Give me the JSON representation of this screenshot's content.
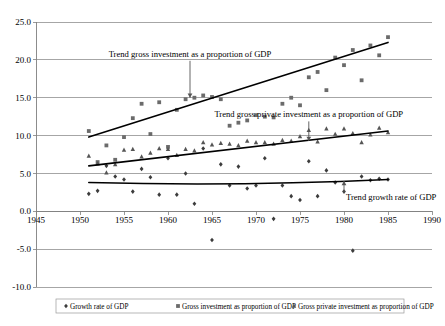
{
  "chart_data": {
    "type": "scatter",
    "title": "",
    "subtitle": "",
    "xlabel": "",
    "ylabel": "",
    "xlim": [
      1945,
      1990
    ],
    "ylim": [
      -10.0,
      25.0
    ],
    "grid": true,
    "legend_position": "bottom",
    "y_ticks": [
      "25.0",
      "20.0",
      "15.0",
      "10.0",
      "5.0",
      "0.0",
      "-5.0",
      "-10.0"
    ],
    "y_tick_values": [
      25.0,
      20.0,
      15.0,
      10.0,
      5.0,
      0.0,
      -5.0,
      -10.0
    ],
    "x_ticks": [
      "1945",
      "1950",
      "1955",
      "1960",
      "1965",
      "1970",
      "1975",
      "1980",
      "1985",
      "1990"
    ],
    "x_tick_values": [
      1945,
      1950,
      1955,
      1960,
      1965,
      1970,
      1975,
      1980,
      1985,
      1990
    ],
    "series": [
      {
        "name": "Growth rate of GDP",
        "marker": "diamond",
        "color": "#3c3c3c",
        "x": [
          1951,
          1952,
          1953,
          1954,
          1955,
          1956,
          1957,
          1958,
          1959,
          1960,
          1961,
          1962,
          1963,
          1964,
          1965,
          1966,
          1967,
          1968,
          1969,
          1970,
          1971,
          1972,
          1973,
          1974,
          1975,
          1976,
          1977,
          1978,
          1979,
          1980,
          1981,
          1982,
          1983,
          1984,
          1985
        ],
        "y": [
          2.3,
          2.7,
          6.0,
          4.6,
          4.2,
          2.6,
          5.6,
          4.5,
          2.2,
          7.0,
          2.2,
          5.0,
          1.0,
          8.3,
          -3.8,
          6.2,
          3.4,
          5.9,
          3.0,
          3.4,
          7.0,
          -1.0,
          3.4,
          2.0,
          1.5,
          6.6,
          2.0,
          5.4,
          3.8,
          2.6,
          -5.2,
          4.6,
          4.1,
          4.3,
          4.2
        ]
      },
      {
        "name": "Gross investment as proportion of GDP",
        "marker": "square",
        "color": "#6b6b6b",
        "x": [
          1951,
          1952,
          1953,
          1954,
          1955,
          1956,
          1957,
          1958,
          1959,
          1960,
          1961,
          1962,
          1963,
          1964,
          1965,
          1966,
          1967,
          1968,
          1969,
          1970,
          1971,
          1972,
          1973,
          1974,
          1975,
          1976,
          1977,
          1978,
          1979,
          1980,
          1981,
          1982,
          1983,
          1984,
          1985
        ],
        "y": [
          10.6,
          6.5,
          8.7,
          6.8,
          9.8,
          12.3,
          14.2,
          10.2,
          14.4,
          8.5,
          13.4,
          14.8,
          15.0,
          15.3,
          15.1,
          14.8,
          11.3,
          11.7,
          12.0,
          12.7,
          12.5,
          12.4,
          14.2,
          15.0,
          14.0,
          17.7,
          18.4,
          16.0,
          20.3,
          19.3,
          21.3,
          17.3,
          21.9,
          20.6,
          23.0
        ]
      },
      {
        "name": "Gross private investment as proportion of GDP",
        "marker": "triangle",
        "color": "#555555",
        "x": [
          1951,
          1952,
          1953,
          1954,
          1955,
          1956,
          1957,
          1958,
          1959,
          1960,
          1961,
          1962,
          1963,
          1964,
          1965,
          1966,
          1967,
          1968,
          1969,
          1970,
          1971,
          1972,
          1973,
          1974,
          1975,
          1976,
          1977,
          1978,
          1979,
          1980,
          1981,
          1982,
          1983,
          1984,
          1985
        ],
        "y": [
          7.3,
          6.3,
          5.1,
          6.2,
          8.1,
          8.2,
          7.2,
          7.7,
          8.3,
          8.2,
          7.4,
          8.2,
          8.0,
          9.1,
          8.8,
          9.0,
          8.9,
          8.7,
          9.3,
          9.1,
          9.1,
          8.9,
          9.4,
          9.3,
          9.9,
          10.7,
          9.2,
          10.9,
          10.2,
          10.9,
          10.3,
          9.1,
          10.1,
          11.0,
          10.4
        ]
      }
    ],
    "trends": [
      {
        "name": "Trend gross investment as a proportion of GDP",
        "x": [
          1951,
          1985
        ],
        "y": [
          9.8,
          22.3
        ]
      },
      {
        "name": "Trend gross private investment as a proportion of GDP",
        "x": [
          1951,
          1985
        ],
        "y": [
          6.0,
          10.6
        ]
      },
      {
        "name": "Trend growth rate of GDP",
        "x": [
          1951,
          1985
        ],
        "y": [
          3.8,
          4.2
        ]
      }
    ],
    "annotations": [
      {
        "text": "Trend gross investment as a proportion of GDP",
        "x": 1962.5,
        "y": 20.4,
        "arrow_to_x": 1962.5,
        "arrow_to_y": 15.0
      },
      {
        "text": "Trend gross private investment as a proportion of GDP",
        "x": 1976.0,
        "y": 12.4,
        "arrow_to_x": 1976.0,
        "arrow_to_y": 9.3
      },
      {
        "text": "Trend growth rate of GDP",
        "x": 1980.0,
        "y": 1.5,
        "arrow_to_x": 1980.0,
        "arrow_to_y": 4.0
      }
    ],
    "legend": [
      {
        "label": "Growth rate of GDP",
        "marker": "diamond"
      },
      {
        "label": "Gross investment as proportion of GDP",
        "marker": "square"
      },
      {
        "label": "Gross private investment as proportion of GDP",
        "marker": "triangle"
      }
    ]
  }
}
